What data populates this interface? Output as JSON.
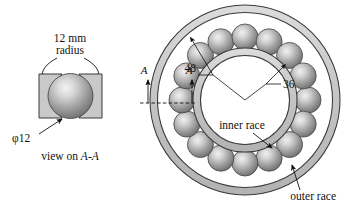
{
  "figure": {
    "background": "#ffffff",
    "ink": "#111111",
    "race_fill": "#c9c9c9",
    "ball_light": "#ededed",
    "ball_mid": "#9a9a9a",
    "ball_dark": "#6f6f6f"
  },
  "detail_view": {
    "radius_label_line1": "12 mm",
    "radius_label_line2": "radius",
    "diameter_label": "φ12",
    "caption_prefix": "view on ",
    "caption_section": "A-A",
    "ball_count": 1
  },
  "bearing": {
    "dimensions": [
      {
        "value": "48",
        "refers_to": "outer-ball-circle-radius"
      },
      {
        "value": "36",
        "refers_to": "inner-race-outer-radius"
      }
    ],
    "labels": {
      "inner_race": "inner race",
      "outer_race": "outer race"
    },
    "section_marks": [
      {
        "label": "A",
        "side": "left"
      },
      {
        "label": "A",
        "side": "right"
      }
    ],
    "ball_count": 16
  }
}
